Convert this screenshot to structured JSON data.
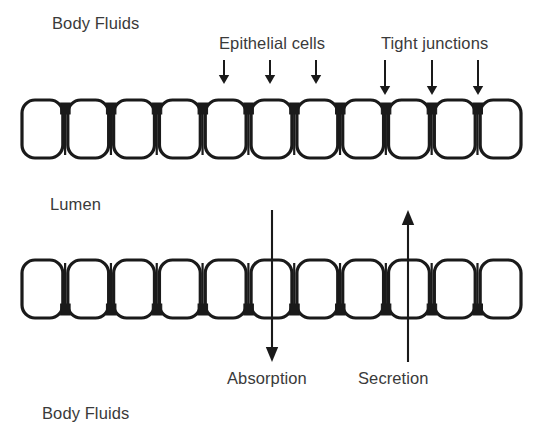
{
  "figure": {
    "type": "biology-diagram",
    "width": 543,
    "height": 439,
    "background_color": "#ffffff",
    "stroke_color": "#1a1a1a",
    "text_color": "#3a3a3a"
  },
  "labels": {
    "body_fluids_top": "Body Fluids",
    "epithelial_cells": "Epithelial cells",
    "tight_junctions": "Tight junctions",
    "lumen": "Lumen",
    "absorption": "Absorption",
    "secretion": "Secretion",
    "body_fluids_bottom": "Body Fluids"
  },
  "cell_layers": [
    {
      "name": "apical-epithelial-layer",
      "position": "top",
      "cell_count": 11,
      "junction_side": "top",
      "junction_count": 10,
      "cell_shape": "rounded-rectangle"
    },
    {
      "name": "basal-epithelial-layer",
      "position": "bottom",
      "cell_count": 11,
      "junction_side": "bottom",
      "junction_count": 10,
      "cell_shape": "rounded-rectangle"
    }
  ],
  "pointer_arrows": [
    {
      "target": "epithelial-cells",
      "x": 224,
      "direction": "down"
    },
    {
      "target": "epithelial-cells",
      "x": 270,
      "direction": "down"
    },
    {
      "target": "epithelial-cells",
      "x": 316,
      "direction": "down"
    },
    {
      "target": "tight-junctions",
      "x": 385,
      "direction": "down"
    },
    {
      "target": "tight-junctions",
      "x": 432,
      "direction": "down"
    },
    {
      "target": "tight-junctions",
      "x": 478,
      "direction": "down"
    }
  ],
  "flow_arrows": [
    {
      "name": "absorption",
      "direction": "down",
      "label": "Absorption",
      "x": 272,
      "from_y": 210,
      "to_y": 362,
      "meaning": "lumen to body fluids"
    },
    {
      "name": "secretion",
      "direction": "up",
      "label": "Secretion",
      "x": 408,
      "from_y": 362,
      "to_y": 210,
      "meaning": "body fluids to lumen"
    }
  ]
}
